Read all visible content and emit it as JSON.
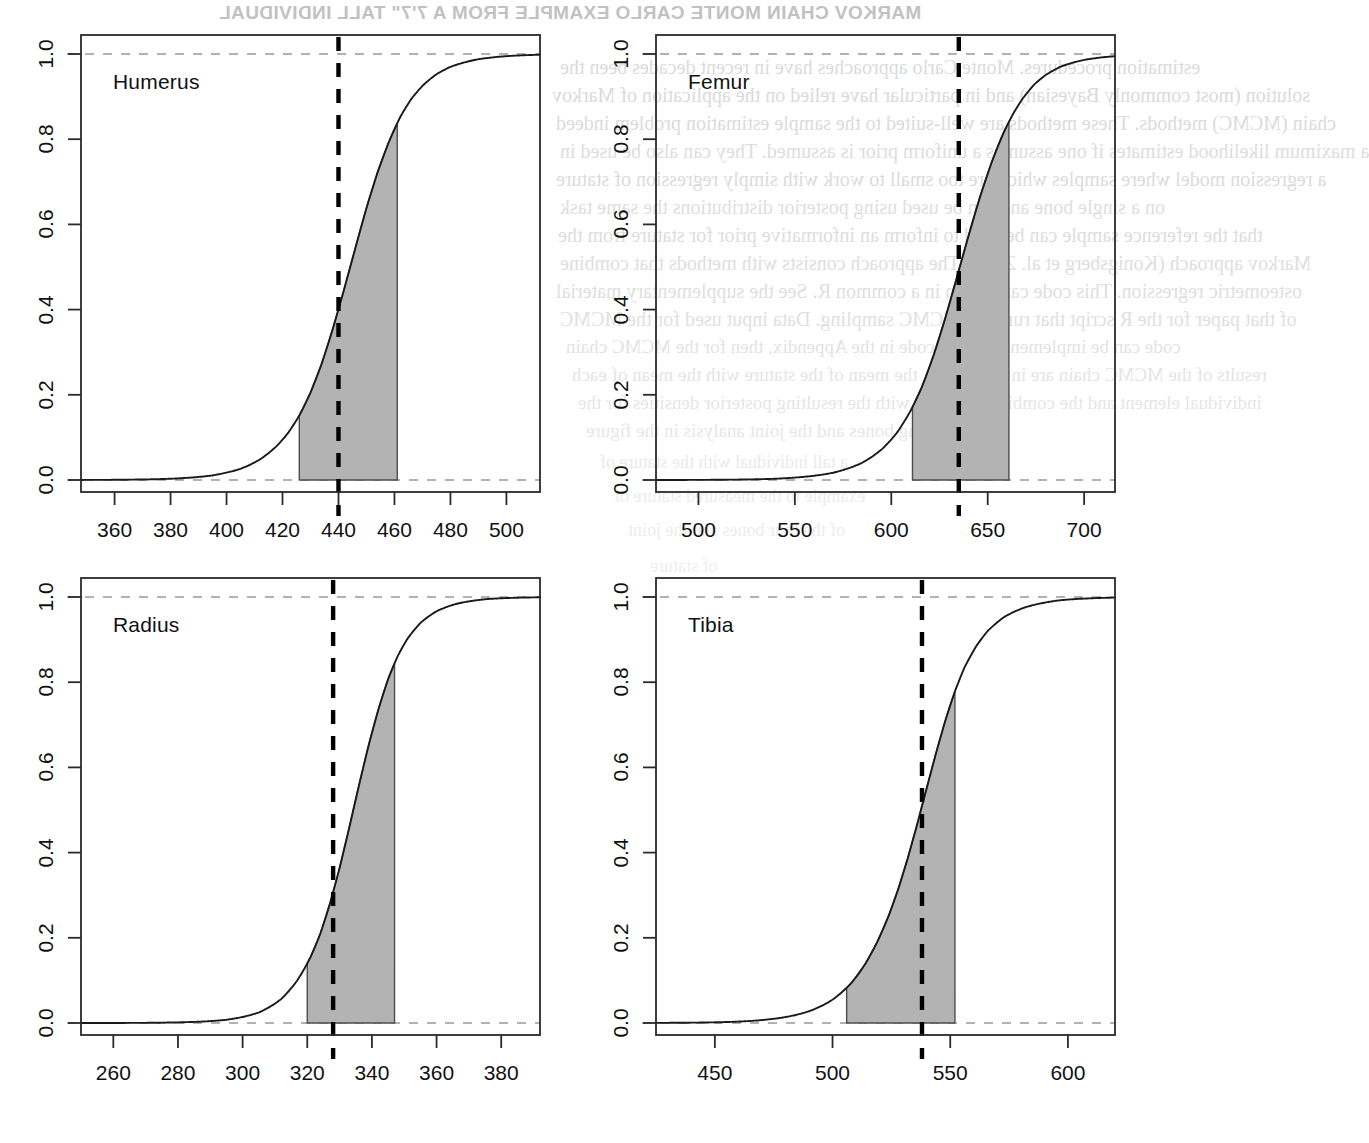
{
  "page": {
    "width": 1140,
    "height": 1143,
    "background": "#ffffff",
    "ink_color": "#111111",
    "shade_color": "#b3b3b3",
    "shade_stroke": "#4d4d4d",
    "dash_color": "#000000",
    "showthrough_color": "#b9b9b9",
    "running_head_mirrored": "MARKOV CHAIN MONTE CARLO EXAMPLE FROM A 7'7\" TALL INDIVIDUAL",
    "showthrough_lines": [
      "estimation procedures. Monte Carlo approaches have in recent decades been the",
      "solution (most commonly Bayesian) and in particular have relied on the application of Markov",
      "chain (MCMC) methods. These methods are well-suited to the sample estimation problem indeed",
      "a maximum likelihood estimates if one assumes a uniform prior is assumed. They can also be used in",
      "a regression model where samples which are too small to work with simply regression of stature",
      "on a single bone and can be used using posterior distributions the same task",
      "that the reference sample can be used to inform an informative prior for stature from the",
      "Markov approach (Konigsberg et al. 2008). The approach consists with methods that combine",
      "osteometric regression. This code can be run in a common R. See the supplementary material",
      "of that paper for the R script that runs the MCMC sampling. Data input used for the MCMC",
      "code can be implemented in the code in the Appendix, then for the MCMC chain",
      "results of the MCMC chain are in Table 2.12, the mean of the stature with the mean of each",
      "individual element and the combined analysis with the resulting posterior densities for the",
      "four long bones and the joint analysis in the figure",
      "a tall individual with the stature of",
      "example to the measured stature of",
      "of the four bones and the joint",
      "of stature"
    ]
  },
  "chart_data": {
    "type": "line",
    "layout": {
      "rows": 2,
      "cols": 2,
      "grid": false,
      "legend": "none"
    },
    "shared": {
      "ylabel": "",
      "xlabel": "",
      "ylim": [
        0.0,
        1.0
      ],
      "yticks": [
        "0.0",
        "0.2",
        "0.4",
        "0.6",
        "0.8",
        "1.0"
      ],
      "ytick_values": [
        0.0,
        0.2,
        0.4,
        0.6,
        0.8,
        1.0
      ],
      "reference_line_y": {
        "value": 1.0,
        "style": "dashed",
        "color": "#999999"
      },
      "baseline_y": {
        "value": 0.0,
        "style": "dashed",
        "color": "#999999"
      }
    },
    "panels": [
      {
        "label": "Humerus",
        "xlim": [
          348,
          512
        ],
        "xticks": [
          "360",
          "380",
          "400",
          "420",
          "440",
          "460",
          "480",
          "500"
        ],
        "xtick_values": [
          360,
          380,
          400,
          420,
          440,
          460,
          480,
          500
        ],
        "vline_value": 440,
        "shade_from": 426,
        "shade_to": 461,
        "curve_mid": 443.5,
        "curve_scale": 11.5,
        "curve": {
          "x": [
            348,
            360,
            380,
            395,
            405,
            412,
            418,
            422,
            426,
            430,
            434,
            438,
            442,
            446,
            450,
            454,
            458,
            462,
            466,
            470,
            475,
            480,
            490,
            500,
            512
          ],
          "y": [
            0.0,
            0.0,
            0.001,
            0.004,
            0.012,
            0.026,
            0.047,
            0.068,
            0.1,
            0.148,
            0.215,
            0.305,
            0.41,
            0.525,
            0.64,
            0.74,
            0.82,
            0.885,
            0.928,
            0.955,
            0.977,
            0.988,
            0.997,
            0.999,
            1.0
          ]
        }
      },
      {
        "label": "Femur",
        "xlim": [
          478,
          716
        ],
        "xticks": [
          "500",
          "550",
          "600",
          "650",
          "700"
        ],
        "xtick_values": [
          500,
          550,
          600,
          650,
          700
        ],
        "vline_value": 635,
        "shade_from": 611,
        "shade_to": 661,
        "curve_mid": 634.0,
        "curve_scale": 17.0,
        "curve": {
          "x": [
            478,
            500,
            540,
            570,
            585,
            595,
            603,
            610,
            616,
            622,
            628,
            634,
            640,
            646,
            652,
            658,
            663,
            668,
            674,
            680,
            688,
            700,
            716
          ],
          "y": [
            0.0,
            0.0,
            0.001,
            0.007,
            0.018,
            0.035,
            0.06,
            0.1,
            0.15,
            0.225,
            0.32,
            0.43,
            0.545,
            0.655,
            0.75,
            0.83,
            0.88,
            0.92,
            0.955,
            0.975,
            0.99,
            0.998,
            1.0
          ]
        }
      },
      {
        "label": "Radius",
        "xlim": [
          250,
          392
        ],
        "xticks": [
          "260",
          "280",
          "300",
          "320",
          "340",
          "360",
          "380"
        ],
        "xtick_values": [
          260,
          280,
          300,
          320,
          340,
          360,
          380
        ],
        "vline_value": 328,
        "shade_from": 320,
        "shade_to": 347,
        "curve_mid": 333.5,
        "curve_scale": 8.5,
        "curve": {
          "x": [
            250,
            270,
            295,
            305,
            312,
            317,
            321,
            324,
            327,
            330,
            333,
            336,
            339,
            342,
            345,
            348,
            351,
            355,
            360,
            366,
            375,
            392
          ],
          "y": [
            0.0,
            0.0,
            0.002,
            0.008,
            0.025,
            0.055,
            0.095,
            0.14,
            0.21,
            0.3,
            0.41,
            0.53,
            0.645,
            0.745,
            0.83,
            0.89,
            0.93,
            0.963,
            0.983,
            0.993,
            0.999,
            1.0
          ]
        }
      },
      {
        "label": "Tibia",
        "xlim": [
          425,
          620
        ],
        "xticks": [
          "450",
          "500",
          "550",
          "600"
        ],
        "xtick_values": [
          450,
          500,
          550,
          600
        ],
        "vline_value": 538,
        "shade_from": 506,
        "shade_to": 552,
        "curve_mid": 534.0,
        "curve_scale": 14.0,
        "curve": {
          "x": [
            425,
            460,
            490,
            500,
            508,
            514,
            519,
            524,
            528,
            532,
            536,
            540,
            544,
            548,
            552,
            556,
            561,
            566,
            573,
            582,
            596,
            620
          ],
          "y": [
            0.0,
            0.0,
            0.002,
            0.006,
            0.018,
            0.04,
            0.07,
            0.115,
            0.17,
            0.245,
            0.34,
            0.45,
            0.565,
            0.675,
            0.77,
            0.845,
            0.905,
            0.945,
            0.975,
            0.99,
            0.999,
            1.0
          ]
        }
      }
    ]
  }
}
